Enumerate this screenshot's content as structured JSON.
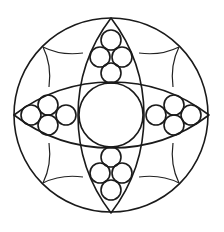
{
  "diagram": {
    "type": "geometric-mandala",
    "colors": {
      "background": "#ffffff",
      "line": "#1a1a1a"
    },
    "outer_circle": {
      "cx": 111,
      "cy": 115,
      "r": 97
    },
    "center_circle": {
      "cx": 111,
      "cy": 115,
      "r": 32
    },
    "lenses": [
      {
        "name": "vertical",
        "tip_a": [
          111,
          18
        ],
        "tip_b": [
          111,
          213
        ],
        "half_width": 33
      },
      {
        "name": "horizontal",
        "tip_a": [
          14,
          115
        ],
        "tip_b": [
          209,
          115
        ],
        "half_height": 33
      }
    ],
    "small_circle_clusters": [
      {
        "name": "top",
        "circles": [
          [
            111,
            40,
            10
          ],
          [
            100,
            57,
            10
          ],
          [
            122,
            57,
            10
          ],
          [
            111,
            73,
            10
          ]
        ]
      },
      {
        "name": "bottom",
        "circles": [
          [
            111,
            157,
            10
          ],
          [
            100,
            173,
            10
          ],
          [
            122,
            173,
            10
          ],
          [
            111,
            190,
            10
          ]
        ]
      },
      {
        "name": "left",
        "circles": [
          [
            31,
            115,
            10
          ],
          [
            48,
            105,
            10
          ],
          [
            48,
            125,
            10
          ],
          [
            66,
            115,
            10
          ]
        ]
      },
      {
        "name": "right",
        "circles": [
          [
            156,
            115,
            10
          ],
          [
            174,
            105,
            10
          ],
          [
            174,
            125,
            10
          ],
          [
            191,
            115,
            10
          ]
        ]
      }
    ],
    "kite_points": [
      [
        43,
        47
      ],
      [
        179,
        47
      ],
      [
        43,
        183
      ],
      [
        179,
        183
      ]
    ]
  }
}
